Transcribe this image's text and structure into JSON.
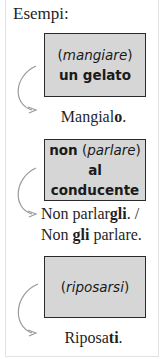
{
  "heading": "Esempi:",
  "examples": [
    {
      "prompt_prefix": "(",
      "prompt_verb": "mangiare",
      "prompt_suffix": ")",
      "prompt_object": "un gelato",
      "result_lines": [
        {
          "plain": "Mangial",
          "bold": "o",
          "end": "."
        }
      ]
    },
    {
      "prompt_lead": "non",
      "prompt_prefix": " (",
      "prompt_verb": "parlare",
      "prompt_suffix": ")",
      "prompt_object": "al conducente",
      "result_lines": [
        {
          "plain": "Non parlar",
          "bold": "gli",
          "end": ". /"
        },
        {
          "plain": "Non ",
          "bold": "gli",
          "end": " parlare."
        }
      ]
    },
    {
      "prompt_prefix": "(",
      "prompt_verb": "riposarsi",
      "prompt_suffix": ")",
      "result_lines": [
        {
          "plain": "Riposa",
          "bold": "ti",
          "end": "."
        }
      ]
    }
  ],
  "colors": {
    "box_fill": "#d6d6d6",
    "box_border": "#2a2a2a",
    "arrow": "#9a9a9a",
    "frame_border": "#e2e2e2"
  },
  "icons": [
    "curved-arrow-icon"
  ]
}
